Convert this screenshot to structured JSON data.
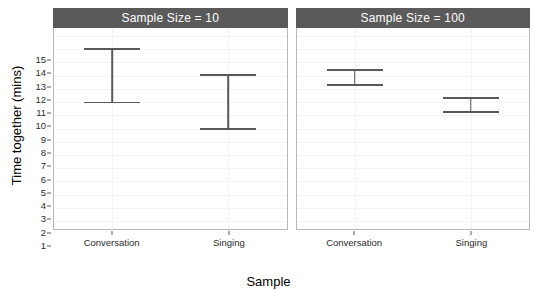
{
  "chart_data": {
    "type": "scatter",
    "title": "",
    "xlabel": "Sample",
    "ylabel": "Time together (mins)",
    "ylim": [
      0.4,
      15.6
    ],
    "yticks": [
      1,
      2,
      3,
      4,
      5,
      6,
      7,
      8,
      9,
      10,
      11,
      12,
      13,
      14,
      15
    ],
    "ytick_labels": [
      "1",
      "2",
      "3",
      "4",
      "5",
      "6",
      "7",
      "8",
      "9",
      "10",
      "11",
      "12",
      "13",
      "14",
      "15"
    ],
    "categories": [
      "Conversation",
      "Singing"
    ],
    "grid": true,
    "legend": "none",
    "facet_variable": "Sample Size",
    "panels": [
      {
        "strip_label": "Sample Size = 10",
        "points": [
          {
            "category": "Conversation",
            "mean": 12.0,
            "lower": 9.9,
            "upper": 14.1
          },
          {
            "category": "Singing",
            "mean": 10.0,
            "lower": 7.9,
            "upper": 12.1
          }
        ]
      },
      {
        "strip_label": "Sample Size = 100",
        "points": [
          {
            "category": "Conversation",
            "mean": 11.85,
            "lower": 11.2,
            "upper": 12.5
          },
          {
            "category": "Singing",
            "mean": 9.8,
            "lower": 9.2,
            "upper": 10.4
          }
        ]
      }
    ]
  },
  "colors": {
    "strip_background": "#5a5a5a",
    "strip_text": "#ffffff",
    "point": "#5b5b5b",
    "errorbar": "#595959",
    "panel_background": "#ffffff",
    "panel_border": "#b9b9b9",
    "gridline": "#f4f4f5",
    "axis_text": "#2b2b2b"
  }
}
